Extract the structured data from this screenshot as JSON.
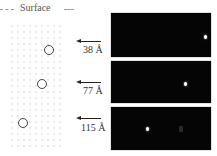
{
  "diagram": {
    "surface_label": "Surface",
    "depths": [
      {
        "label": "38 Å",
        "circle": {
          "x": 44,
          "y": 45
        },
        "arrow_y": 41,
        "label_y": 44,
        "panel_top": 13,
        "panel_height": 44,
        "spot": {
          "x": 96,
          "y": 22
        }
      },
      {
        "label": "77 Å",
        "circle": {
          "x": 37,
          "y": 79
        },
        "arrow_y": 82,
        "label_y": 85,
        "panel_top": 61,
        "panel_height": 42,
        "spot": {
          "x": 77,
          "y": 21
        }
      },
      {
        "label": "115 Å",
        "circle": {
          "x": 18,
          "y": 118
        },
        "arrow_y": 118,
        "label_y": 122,
        "panel_top": 107,
        "panel_height": 43,
        "spot": {
          "x": 36,
          "y": 20
        },
        "ghost": {
          "x": 68,
          "y": 19
        }
      }
    ]
  }
}
